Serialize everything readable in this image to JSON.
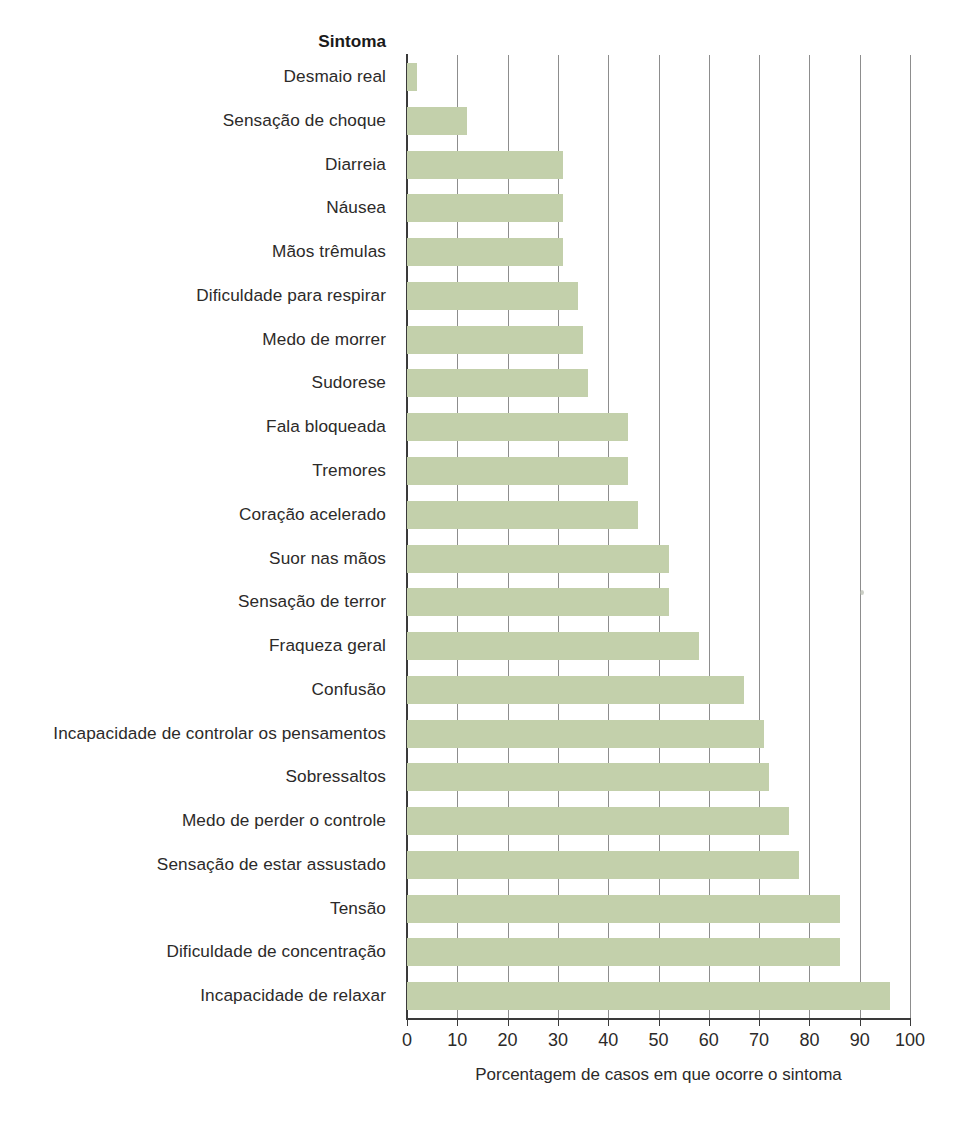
{
  "chart_data": {
    "type": "bar",
    "orientation": "horizontal",
    "title": "",
    "category_axis_title": "Sintoma",
    "xlabel": "Porcentagem de casos em que ocorre o sintoma",
    "ylabel": "",
    "xlim": [
      0,
      100
    ],
    "xticks": [
      0,
      10,
      20,
      30,
      40,
      50,
      60,
      70,
      80,
      90,
      100
    ],
    "grid": true,
    "grid_axis": "x",
    "legend": false,
    "bar_color": "#c3d0ab",
    "categories": [
      "Desmaio real",
      "Sensação de choque",
      "Diarreia",
      "Náusea",
      "Mãos trêmulas",
      "Dificuldade para respirar",
      "Medo de morrer",
      "Sudorese",
      "Fala bloqueada",
      "Tremores",
      "Coração acelerado",
      "Suor nas mãos",
      "Sensação de terror",
      "Fraqueza geral",
      "Confusão",
      "Incapacidade de controlar os pensamentos",
      "Sobressaltos",
      "Medo de perder o controle",
      "Sensação de estar assustado",
      "Tensão",
      "Dificuldade de concentração",
      "Incapacidade de relaxar"
    ],
    "values": [
      2,
      12,
      31,
      31,
      31,
      34,
      35,
      36,
      44,
      44,
      46,
      52,
      52,
      58,
      67,
      71,
      72,
      76,
      78,
      86,
      86,
      96
    ]
  }
}
